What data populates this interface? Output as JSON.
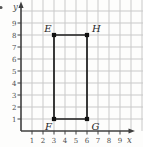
{
  "figure": {
    "problem_fragment": ".",
    "axis_labels": {
      "x": "x",
      "y": "y"
    },
    "x_tick_labels": [
      "1",
      "2",
      "3",
      "4",
      "5",
      "6",
      "7",
      "8",
      "9"
    ],
    "y_tick_labels": [
      "1",
      "2",
      "3",
      "4",
      "5",
      "6",
      "7",
      "8",
      "9"
    ],
    "vertices": [
      {
        "name": "E",
        "x": 3,
        "y": 8,
        "label_pos": "above-left"
      },
      {
        "name": "H",
        "x": 6,
        "y": 8,
        "label_pos": "above-right"
      },
      {
        "name": "G",
        "x": 6,
        "y": 1,
        "label_pos": "below-right"
      },
      {
        "name": "F",
        "x": 3,
        "y": 1,
        "label_pos": "below-left"
      }
    ],
    "colors": {
      "grid": "#c9c9c9",
      "axis": "#3f3f3f",
      "shape": "#1c1c1c",
      "point": "#111111",
      "tick_text": "#4d4d4d",
      "vertex_text": "#2a2a2a"
    }
  },
  "chart_data": {
    "type": "scatter",
    "title": "",
    "shape": "rectangle",
    "points": [
      {
        "label": "E",
        "x": 3,
        "y": 8
      },
      {
        "label": "H",
        "x": 6,
        "y": 8
      },
      {
        "label": "G",
        "x": 6,
        "y": 1
      },
      {
        "label": "F",
        "x": 3,
        "y": 1
      }
    ],
    "xlabel": "x",
    "ylabel": "y",
    "xlim": [
      0,
      10
    ],
    "ylim": [
      0,
      10
    ],
    "xticks": [
      1,
      2,
      3,
      4,
      5,
      6,
      7,
      8,
      9
    ],
    "yticks": [
      1,
      2,
      3,
      4,
      5,
      6,
      7,
      8,
      9
    ],
    "grid": true,
    "legend": false
  }
}
